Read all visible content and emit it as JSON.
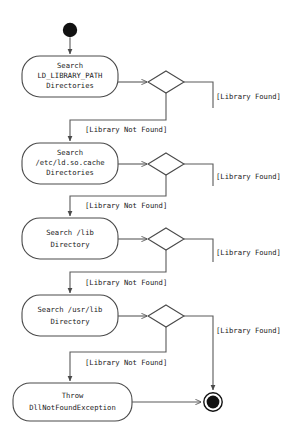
{
  "diagram": {
    "kind": "uml-activity-diagram",
    "colors": {
      "background": "#ffffff",
      "node_stroke": "#4a4a4a",
      "edge_stroke": "#5a5a5a",
      "text": "#1a1a1a",
      "terminal_fill": "#111111"
    },
    "start_node": {
      "label": ""
    },
    "end_node": {
      "label": ""
    },
    "activities": [
      {
        "id": "search-ld-library-path",
        "lines": [
          "Search",
          "LD_LIBRARY_PATH",
          "Directories"
        ]
      },
      {
        "id": "search-etc-ld-so-cache",
        "lines": [
          "Search",
          "/etc/ld.so.cache",
          "Directories"
        ]
      },
      {
        "id": "search-lib",
        "lines": [
          "Search /lib",
          "Directory"
        ]
      },
      {
        "id": "search-usr-lib",
        "lines": [
          "Search /usr/lib",
          "Directory"
        ]
      },
      {
        "id": "throw-dll-not-found",
        "lines": [
          "Throw",
          "DllNotFoundException"
        ]
      }
    ],
    "decisions": [
      {
        "id": "decision-1"
      },
      {
        "id": "decision-2"
      },
      {
        "id": "decision-3"
      },
      {
        "id": "decision-4"
      }
    ],
    "guards": {
      "found": "[Library Found]",
      "not_found": "[Library Not Found]"
    },
    "found_labels": [
      "[Library Found]",
      "[Library Found]",
      "[Library Found]",
      "[Library Found]"
    ],
    "not_found_labels": [
      "[Library Not Found]",
      "[Library Not Found]",
      "[Library Not Found]",
      "[Library Not Found]"
    ]
  }
}
